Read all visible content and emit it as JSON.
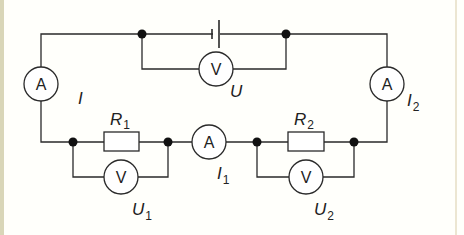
{
  "diagram": {
    "type": "electric-circuit",
    "colors": {
      "wire": "#2a2a2a",
      "node": "#111111",
      "background": "#fffffb",
      "frame_border": "#d9d6b8"
    },
    "components": {
      "battery": {
        "symbol": "cell"
      },
      "ammeter_main": {
        "letter": "A",
        "label": "I",
        "label_sub": ""
      },
      "ammeter_1": {
        "letter": "A",
        "label": "I",
        "label_sub": "1"
      },
      "ammeter_2": {
        "letter": "A",
        "label": "I",
        "label_sub": "2"
      },
      "voltmeter_total": {
        "letter": "V",
        "label": "U",
        "label_sub": ""
      },
      "voltmeter_1": {
        "letter": "V",
        "label": "U",
        "label_sub": "1"
      },
      "voltmeter_2": {
        "letter": "V",
        "label": "U",
        "label_sub": "2"
      },
      "resistor_1": {
        "label": "R",
        "label_sub": "1"
      },
      "resistor_2": {
        "label": "R",
        "label_sub": "2"
      }
    }
  }
}
